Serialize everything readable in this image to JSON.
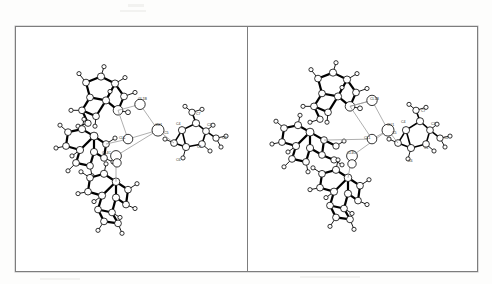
{
  "figure": {
    "kind": "crystal-structure-diagram",
    "style": "ORTEP ball-and-stick",
    "panel_count": 2,
    "border_color": "#7d7d7d",
    "background_color": "#ffffff",
    "atom_fill": "#ffffff",
    "bond_color": "#000000",
    "contact_color": "#9a9a9a",
    "label_color": "#2b2b2b"
  },
  "panels": [
    {
      "id": "panel-left",
      "name": "left-panel",
      "labels": [
        {
          "text": "CL1B",
          "x": 122,
          "y": 74
        },
        {
          "text": "CU1",
          "x": 139,
          "y": 100
        },
        {
          "text": "CL1",
          "x": 103,
          "y": 113
        },
        {
          "text": "CL4C",
          "x": 86,
          "y": 128
        },
        {
          "text": "C4",
          "x": 160,
          "y": 99
        },
        {
          "text": "C5",
          "x": 148,
          "y": 108
        },
        {
          "text": "C7",
          "x": 180,
          "y": 89
        },
        {
          "text": "C3",
          "x": 191,
          "y": 100
        },
        {
          "text": "C2",
          "x": 206,
          "y": 113
        },
        {
          "text": "C1",
          "x": 181,
          "y": 122
        },
        {
          "text": "C6",
          "x": 160,
          "y": 135
        }
      ]
    },
    {
      "id": "panel-right",
      "name": "right-panel",
      "labels": [
        {
          "text": "CL1B",
          "x": 122,
          "y": 74
        },
        {
          "text": "CU1",
          "x": 139,
          "y": 100
        },
        {
          "text": "CL1",
          "x": 116,
          "y": 113
        },
        {
          "text": "CL4C",
          "x": 99,
          "y": 128
        },
        {
          "text": "C4",
          "x": 153,
          "y": 97
        },
        {
          "text": "C5",
          "x": 144,
          "y": 108
        },
        {
          "text": "C7",
          "x": 173,
          "y": 86
        },
        {
          "text": "C3",
          "x": 183,
          "y": 99
        },
        {
          "text": "C2",
          "x": 196,
          "y": 113
        },
        {
          "text": "C1",
          "x": 176,
          "y": 123
        },
        {
          "text": "C6",
          "x": 160,
          "y": 136
        }
      ]
    }
  ]
}
